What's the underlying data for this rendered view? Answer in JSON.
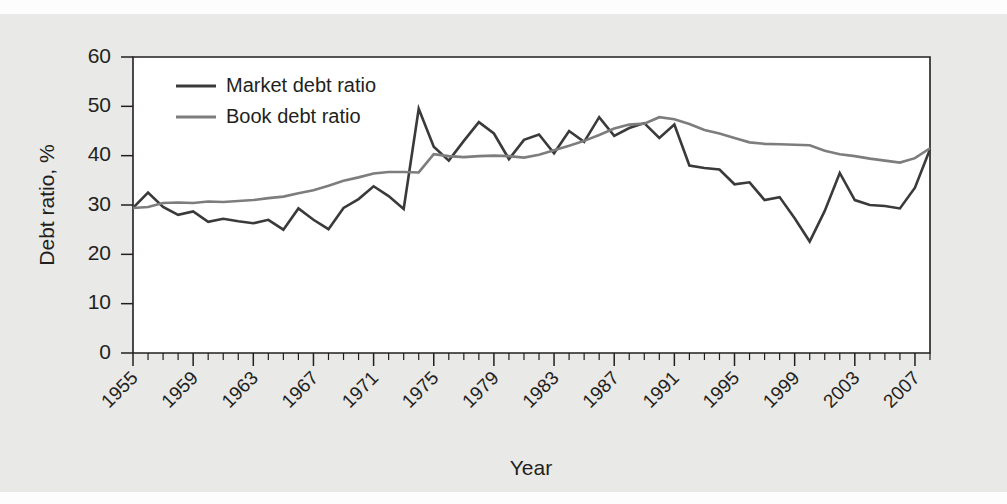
{
  "chart_data": {
    "type": "line",
    "title": "",
    "xlabel": "Year",
    "ylabel": "Debt ratio, %",
    "xlim": [
      1955,
      2008
    ],
    "ylim": [
      0,
      60
    ],
    "grid": false,
    "legend_position": "top-left-inside",
    "y_ticks": [
      0,
      10,
      20,
      30,
      40,
      50,
      60
    ],
    "y_tick_labels": [
      "0",
      "10",
      "20",
      "30",
      "40",
      "50",
      "60"
    ],
    "x_ticks": [
      1955,
      1959,
      1963,
      1967,
      1971,
      1975,
      1979,
      1983,
      1987,
      1991,
      1995,
      1999,
      2003,
      2007
    ],
    "x_tick_labels": [
      "1955",
      "1959",
      "1963",
      "1967",
      "1971",
      "1975",
      "1979",
      "1983",
      "1987",
      "1991",
      "1995",
      "1999",
      "2003",
      "2007"
    ],
    "x_minor_tick_interval": 1,
    "x": [
      1955,
      1956,
      1957,
      1958,
      1959,
      1960,
      1961,
      1962,
      1963,
      1964,
      1965,
      1966,
      1967,
      1968,
      1969,
      1970,
      1971,
      1972,
      1973,
      1974,
      1975,
      1976,
      1977,
      1978,
      1979,
      1980,
      1981,
      1982,
      1983,
      1984,
      1985,
      1986,
      1987,
      1988,
      1989,
      1990,
      1991,
      1992,
      1993,
      1994,
      1995,
      1996,
      1997,
      1998,
      1999,
      2000,
      2001,
      2002,
      2003,
      2004,
      2005,
      2006,
      2007,
      2008
    ],
    "series": [
      {
        "name": "Market debt ratio",
        "color": "#3a3a3a",
        "linewidth": 2.6,
        "values": [
          29.4,
          32.5,
          29.6,
          28.0,
          28.7,
          26.6,
          27.2,
          26.7,
          26.3,
          27.0,
          25.0,
          29.3,
          27.0,
          25.1,
          29.4,
          31.2,
          33.8,
          31.8,
          29.2,
          49.5,
          41.8,
          39.0,
          43.0,
          46.8,
          44.5,
          39.3,
          43.2,
          44.3,
          40.5,
          45.0,
          42.8,
          47.8,
          44.0,
          45.6,
          46.6,
          43.6,
          46.3,
          38.0,
          37.5,
          37.2,
          34.2,
          34.6,
          31.0,
          31.6,
          27.3,
          22.6,
          28.8,
          36.5,
          31.0,
          30.0,
          29.8,
          29.3,
          33.5,
          41.3
        ]
      },
      {
        "name": "Book debt ratio",
        "color": "#7d7d7d",
        "linewidth": 2.6,
        "values": [
          29.4,
          29.6,
          30.4,
          30.5,
          30.4,
          30.7,
          30.6,
          30.8,
          31.0,
          31.4,
          31.7,
          32.4,
          33.0,
          33.9,
          34.9,
          35.6,
          36.4,
          36.7,
          36.7,
          36.6,
          40.3,
          39.9,
          39.7,
          39.9,
          40.0,
          39.9,
          39.6,
          40.2,
          41.1,
          42.0,
          43.0,
          44.2,
          45.5,
          46.3,
          46.5,
          47.8,
          47.4,
          46.4,
          45.2,
          44.5,
          43.6,
          42.7,
          42.4,
          42.3,
          42.2,
          42.1,
          41.0,
          40.3,
          39.9,
          39.4,
          39.0,
          38.6,
          39.5,
          41.5
        ]
      }
    ]
  },
  "legend": {
    "entries": [
      {
        "label": "Market debt ratio"
      },
      {
        "label": "Book debt ratio"
      }
    ]
  },
  "colors": {
    "market_series": "#3a3a3a",
    "book_series": "#7d7d7d",
    "axis": "#231f20",
    "plot_background": "#ffffff",
    "figure_background": "#e9e9e7"
  }
}
